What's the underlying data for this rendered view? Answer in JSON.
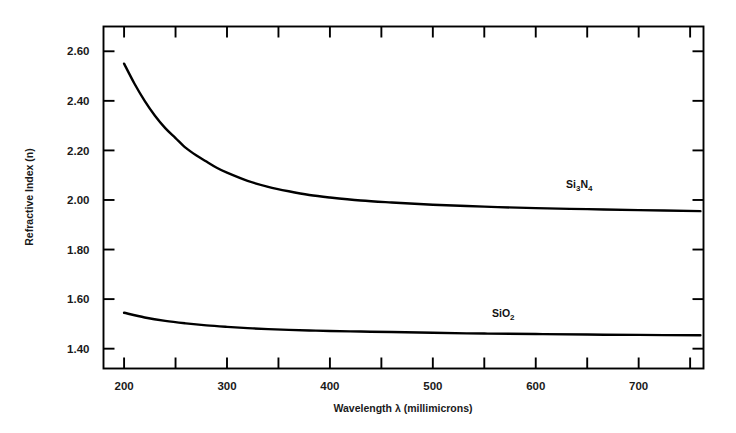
{
  "chart_data": {
    "type": "line",
    "title": "",
    "xlabel": "Wavelength λ (millimicrons)",
    "ylabel": "Refractive Index (n)",
    "xlim": [
      180,
      763
    ],
    "ylim": [
      1.32,
      2.7
    ],
    "grid": false,
    "legend_position": "inline-annotation",
    "xticks": [
      200,
      300,
      400,
      500,
      600,
      700
    ],
    "xtick_labels": [
      "200",
      "300",
      "400",
      "500",
      "600",
      "700"
    ],
    "xminor_ticks": [
      250,
      350,
      450,
      550,
      650,
      750
    ],
    "yticks": [
      2.6,
      2.4,
      2.2,
      2.0,
      1.8,
      1.6,
      1.4
    ],
    "ytick_labels": [
      "2.60",
      "2.40",
      "2.20",
      "2.00",
      "1.80",
      "1.60",
      "1.40"
    ],
    "series": [
      {
        "name": "Si3N4",
        "label_text": "Si",
        "label_sub1": "3",
        "label_mid": "N",
        "label_sub2": "4",
        "color": "#000000",
        "x": [
          200,
          210,
          220,
          230,
          240,
          250,
          260,
          270,
          280,
          290,
          300,
          320,
          340,
          360,
          380,
          400,
          430,
          460,
          500,
          550,
          600,
          650,
          700,
          760
        ],
        "y": [
          2.55,
          2.47,
          2.4,
          2.34,
          2.29,
          2.25,
          2.21,
          2.18,
          2.155,
          2.13,
          2.11,
          2.077,
          2.053,
          2.035,
          2.02,
          2.01,
          1.998,
          1.99,
          1.981,
          1.973,
          1.967,
          1.963,
          1.959,
          1.955
        ]
      },
      {
        "name": "SiO2",
        "label_text": "SiO",
        "label_sub1": "2",
        "color": "#000000",
        "x": [
          200,
          220,
          240,
          260,
          280,
          300,
          320,
          340,
          360,
          380,
          400,
          430,
          460,
          500,
          550,
          600,
          650,
          700,
          760
        ],
        "y": [
          1.545,
          1.526,
          1.512,
          1.502,
          1.494,
          1.488,
          1.483,
          1.479,
          1.476,
          1.4735,
          1.4715,
          1.469,
          1.467,
          1.464,
          1.461,
          1.459,
          1.457,
          1.4555,
          1.454
        ]
      }
    ],
    "annotations": [
      {
        "name": "si3n4-label",
        "x": 596,
        "y": 2.08
      },
      {
        "name": "sio2-label",
        "x": 512,
        "y": 1.555
      }
    ]
  },
  "axis": {
    "y_title": "Refractive Index (n)",
    "x_title_parts": {
      "word1": "Wavelength",
      "lambda": "λ",
      "unit": "(millimicrons)"
    }
  },
  "colors": {
    "background": "#ffffff",
    "axis": "#000000",
    "curve": "#000000",
    "text": "#1a1a1a"
  }
}
